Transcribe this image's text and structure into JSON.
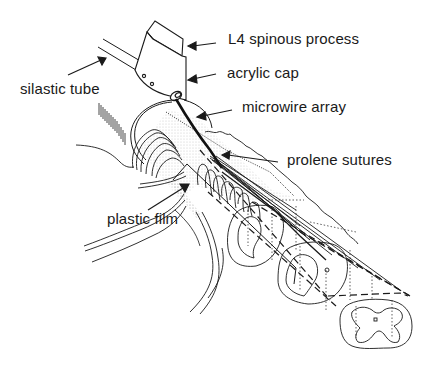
{
  "figure": {
    "type": "anatomical schematic",
    "labels": [
      {
        "id": "l4",
        "text": "L4 spinous process"
      },
      {
        "id": "cap",
        "text": "acrylic cap"
      },
      {
        "id": "micro",
        "text": "microwire array"
      },
      {
        "id": "prolene",
        "text": "prolene sutures"
      },
      {
        "id": "tube",
        "text": "silastic tube"
      },
      {
        "id": "film",
        "text": "plastic film"
      }
    ],
    "colors": {
      "background": "#ffffff",
      "ink": "#1a1a1a",
      "stipple": "#9a9a9a"
    },
    "cross_sections": 3
  }
}
